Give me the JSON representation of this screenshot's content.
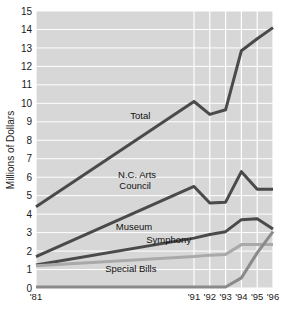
{
  "chart_data": {
    "type": "line",
    "title": "",
    "subtitle": "",
    "xlabel": "",
    "ylabel": "Millions of Dollars",
    "x": [
      1981,
      1991,
      1992,
      1993,
      1994,
      1995,
      1996
    ],
    "xtick_labels": [
      "'81",
      "'91",
      "'92",
      "'93",
      "'94",
      "'95",
      "'96"
    ],
    "ytick_labels": [
      "0",
      "1",
      "2",
      "3",
      "4",
      "5",
      "6",
      "7",
      "8",
      "9",
      "10",
      "11",
      "12",
      "13",
      "14",
      "15"
    ],
    "ylim": [
      0,
      15
    ],
    "xlim": [
      1981,
      1996
    ],
    "grid": true,
    "grid_color": "#ffffff",
    "plot_background": "#d7d7d7",
    "legend_position": "inline-labels",
    "series": [
      {
        "name": "Total",
        "label": "Total",
        "color": "#4a4a4a",
        "width": 3.0,
        "values": [
          4.4,
          10.1,
          9.4,
          9.65,
          12.85,
          13.5,
          14.1
        ],
        "label_x": 1987.6,
        "label_y": 9.15
      },
      {
        "name": "N.C. Arts Council",
        "label": "N.C. Arts",
        "label_line2": "Council",
        "color": "#4a4a4a",
        "width": 3.0,
        "values": [
          1.7,
          5.5,
          4.6,
          4.65,
          6.3,
          5.35,
          5.35
        ],
        "label_x": 1987.4,
        "label_y": 5.95
      },
      {
        "name": "Museum",
        "label": "Museum",
        "color": "#4a4a4a",
        "width": 3.0,
        "values": [
          1.25,
          2.7,
          2.9,
          3.05,
          3.7,
          3.75,
          3.2
        ],
        "label_x": 1987.2,
        "label_y": 3.15
      },
      {
        "name": "Symphony",
        "label": "Symphony",
        "color": "#a9a9a9",
        "width": 3.0,
        "values": [
          1.2,
          1.7,
          1.78,
          1.82,
          2.35,
          2.35,
          2.35
        ],
        "label_x": 1989.4,
        "label_y": 2.45
      },
      {
        "name": "Special Bills",
        "label": "Special Bills",
        "color": "#8a8a8a",
        "width": 3.0,
        "values": [
          0.05,
          0.05,
          0.05,
          0.05,
          0.55,
          1.9,
          3.05
        ],
        "label_x": 1987.0,
        "label_y": 0.85
      }
    ]
  },
  "axes": {
    "y_title": "Millions of Dollars"
  }
}
